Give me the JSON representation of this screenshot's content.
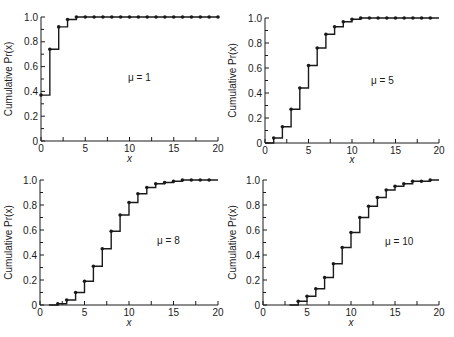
{
  "figure": {
    "panel_count": 4,
    "line_color": "#1a1a1a"
  },
  "chart_data": [
    {
      "type": "line",
      "step": true,
      "title": "",
      "annotation": "μ = 1",
      "xlabel": "x",
      "ylabel": "Cumulative Pr(x)",
      "xlim": [
        0,
        20
      ],
      "ylim": [
        0,
        1.0
      ],
      "xticks": [
        "0",
        "5",
        "10",
        "15",
        "20"
      ],
      "yticks": [
        "0",
        "0.2",
        "0.4",
        "0.6",
        "0.8",
        "1.0"
      ],
      "grid": false,
      "legend": false,
      "x": [
        0,
        1,
        2,
        3,
        4,
        5,
        6,
        7,
        8,
        9,
        10,
        11,
        12,
        13,
        14,
        15,
        16,
        17,
        18,
        19,
        20
      ],
      "values": [
        0.37,
        0.74,
        0.92,
        0.98,
        1.0,
        1.0,
        1.0,
        1.0,
        1.0,
        1.0,
        1.0,
        1.0,
        1.0,
        1.0,
        1.0,
        1.0,
        1.0,
        1.0,
        1.0,
        1.0,
        1.0
      ]
    },
    {
      "type": "line",
      "step": true,
      "title": "",
      "annotation": "μ = 5",
      "xlabel": "x",
      "ylabel": "Cumulative Pr(x)",
      "xlim": [
        0,
        20
      ],
      "ylim": [
        0,
        1.0
      ],
      "xticks": [
        "0",
        "5",
        "10",
        "15",
        "20"
      ],
      "yticks": [
        "0",
        "0.2",
        "0.4",
        "0.6",
        "0.8",
        "1.0"
      ],
      "grid": false,
      "legend": false,
      "x": [
        1,
        2,
        3,
        4,
        5,
        6,
        7,
        8,
        9,
        10,
        11,
        12,
        13,
        14,
        15,
        16,
        17,
        18,
        19
      ],
      "values": [
        0.04,
        0.13,
        0.27,
        0.44,
        0.62,
        0.76,
        0.87,
        0.93,
        0.97,
        0.99,
        1.0,
        1.0,
        1.0,
        1.0,
        1.0,
        1.0,
        1.0,
        1.0,
        1.0
      ]
    },
    {
      "type": "line",
      "step": true,
      "title": "",
      "annotation": "μ = 8",
      "xlabel": "x",
      "ylabel": "Cumulative Pr(x)",
      "xlim": [
        0,
        20
      ],
      "ylim": [
        0,
        1.0
      ],
      "xticks": [
        "0",
        "5",
        "10",
        "15",
        "20"
      ],
      "yticks": [
        "0",
        "0.2",
        "0.4",
        "0.6",
        "0.8",
        "1.0"
      ],
      "grid": false,
      "legend": false,
      "x": [
        2,
        3,
        4,
        5,
        6,
        7,
        8,
        9,
        10,
        11,
        12,
        13,
        14,
        15,
        16,
        17,
        18,
        19
      ],
      "values": [
        0.01,
        0.04,
        0.1,
        0.19,
        0.31,
        0.45,
        0.59,
        0.72,
        0.82,
        0.89,
        0.94,
        0.97,
        0.98,
        0.99,
        1.0,
        1.0,
        1.0,
        1.0
      ]
    },
    {
      "type": "line",
      "step": true,
      "title": "",
      "annotation": "μ = 10",
      "xlabel": "x",
      "ylabel": "Cumulative Pr(x)",
      "xlim": [
        0,
        20
      ],
      "ylim": [
        0,
        1.0
      ],
      "xticks": [
        "0",
        "5",
        "10",
        "15",
        "20"
      ],
      "yticks": [
        "0",
        "0.2",
        "0.4",
        "0.6",
        "0.8",
        "1.0"
      ],
      "grid": false,
      "legend": false,
      "x": [
        4,
        5,
        6,
        7,
        8,
        9,
        10,
        11,
        12,
        13,
        14,
        15,
        16,
        17,
        18,
        19
      ],
      "values": [
        0.03,
        0.07,
        0.13,
        0.22,
        0.33,
        0.46,
        0.58,
        0.7,
        0.79,
        0.86,
        0.92,
        0.95,
        0.97,
        0.99,
        0.99,
        1.0
      ]
    }
  ],
  "panels": [
    {
      "annotation": "μ = 1",
      "xlabel": "x",
      "ylabel": "Cumulative Pr(x)"
    },
    {
      "annotation": "μ = 5",
      "xlabel": "x",
      "ylabel": "Cumulative Pr(x)"
    },
    {
      "annotation": "μ = 8",
      "xlabel": "x",
      "ylabel": "Cumulative Pr(x)"
    },
    {
      "annotation": "μ = 10",
      "xlabel": "x",
      "ylabel": "Cumulative Pr(x)"
    }
  ]
}
